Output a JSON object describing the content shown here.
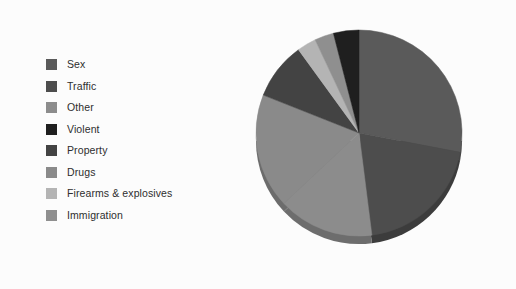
{
  "figure": {
    "background_color": "#fcfcfc",
    "title": ""
  },
  "legend": {
    "position": "left",
    "items": [
      {
        "label": "Sex",
        "color": "#5a5a5a"
      },
      {
        "label": "Traffic",
        "color": "#4d4d4d"
      },
      {
        "label": "Other",
        "color": "#8c8c8c"
      },
      {
        "label": "Violent",
        "color": "#1f1f1f"
      },
      {
        "label": "Property",
        "color": "#434343"
      },
      {
        "label": "Drugs",
        "color": "#8a8a8a"
      },
      {
        "label": "Firearms & explosives",
        "color": "#b4b4b4"
      },
      {
        "label": "Immigration",
        "color": "#8f8f8f"
      }
    ]
  },
  "chart_data": {
    "type": "pie",
    "title": "",
    "xlabel": "",
    "ylabel": "",
    "start_angle_deg": 0,
    "direction": "clockwise",
    "has_depth_shading": true,
    "labels": [
      "Sex",
      "Traffic",
      "Other",
      "Violent",
      "Property",
      "Drugs",
      "Firearms & explosives",
      "Immigration"
    ],
    "colors": [
      "#5a5a5a",
      "#4d4d4d",
      "#8c8c8c",
      "#1f1f1f",
      "#434343",
      "#8a8a8a",
      "#b4b4b4",
      "#8f8f8f"
    ],
    "values": [
      28,
      20,
      15,
      4,
      9,
      18,
      3,
      3
    ],
    "percentages": [
      28,
      20,
      15,
      4,
      9,
      18,
      3,
      3
    ],
    "slices": [
      {
        "label": "Sex",
        "percent": 28,
        "start_deg": 0,
        "end_deg": 100.8,
        "color": "#5a5a5a"
      },
      {
        "label": "Traffic",
        "percent": 20,
        "start_deg": 100.8,
        "end_deg": 172.8,
        "color": "#4d4d4d"
      },
      {
        "label": "Other",
        "percent": 15,
        "start_deg": 172.8,
        "end_deg": 226.8,
        "color": "#8c8c8c"
      },
      {
        "label": "Drugs",
        "percent": 18,
        "start_deg": 226.8,
        "end_deg": 291.6,
        "color": "#8a8a8a"
      },
      {
        "label": "Property",
        "percent": 9,
        "start_deg": 291.6,
        "end_deg": 324.0,
        "color": "#434343"
      },
      {
        "label": "Firearms & explosives",
        "percent": 3,
        "start_deg": 324.0,
        "end_deg": 334.8,
        "color": "#b4b4b4"
      },
      {
        "label": "Immigration",
        "percent": 3,
        "start_deg": 334.8,
        "end_deg": 345.6,
        "color": "#8f8f8f"
      },
      {
        "label": "Violent",
        "percent": 4,
        "start_deg": 345.6,
        "end_deg": 360.0,
        "color": "#1f1f1f"
      }
    ],
    "geometry": {
      "center_x": 107,
      "center_y": 107,
      "radius_x": 103,
      "radius_y": 103,
      "depth_px": 8,
      "rim_color": "#6f6f6f"
    }
  }
}
